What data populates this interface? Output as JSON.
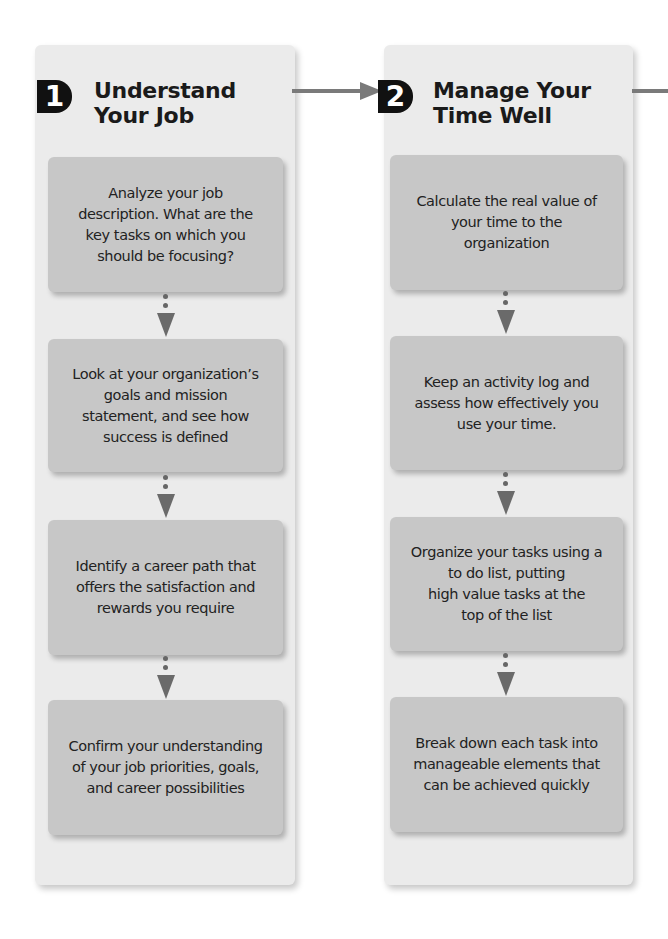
{
  "diagram": {
    "type": "process flow",
    "colors": {
      "panel_bg": "#ebebeb",
      "box_bg": "#c7c7c7",
      "badge_bg": "#111111",
      "connector": "#7a7a7a",
      "text": "#222222"
    },
    "steps": [
      {
        "number": "1",
        "title": "Understand\nYour Job",
        "tasks": [
          "Analyze your job\ndescription. What are the\nkey tasks on which you\nshould be focusing?",
          "Look at your organization’s\ngoals and mission\nstatement, and see how\nsuccess is defined",
          "Identify a career path that\noffers the satisfaction and\nrewards you require",
          "Confirm your understanding\nof your job priorities, goals,\nand career possibilities"
        ]
      },
      {
        "number": "2",
        "title": "Manage Your\nTime Well",
        "tasks": [
          "Calculate the real value of\nyour time to the\norganization",
          "Keep an activity log and\nassess how effectively you\nuse your time.",
          "Organize your tasks using a\nto do list, putting\nhigh value tasks at the\ntop of the list",
          "Break down each task into\nmanageable elements that\ncan be achieved quickly"
        ]
      }
    ]
  }
}
